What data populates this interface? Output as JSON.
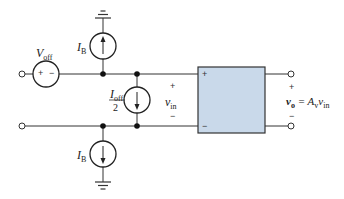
{
  "diagram": {
    "type": "circuit",
    "colors": {
      "wire": "#333333",
      "box_fill": "#c9d9ea",
      "box_stroke": "#333333",
      "node": "#111111"
    },
    "labels": {
      "v_off": {
        "main": "V",
        "sub": "off"
      },
      "ib_top": {
        "main": "I",
        "sub": "B"
      },
      "ib_bottom": {
        "main": "I",
        "sub": "B"
      },
      "i_off": {
        "main": "I",
        "sub": "off",
        "denominator": "2"
      },
      "v_in": {
        "main": "v",
        "sub": "in"
      },
      "v_out": {
        "main": "v",
        "sub": "o",
        "eq": " = A",
        "gain_sub": "v",
        "tail": "v",
        "tail_sub": "in"
      }
    },
    "signs": {
      "source_plus": "+",
      "source_minus": "−",
      "vin_plus": "+",
      "vin_minus": "−",
      "box_plus": "+",
      "box_minus": "−",
      "out_plus": "+",
      "out_minus": "−"
    }
  }
}
